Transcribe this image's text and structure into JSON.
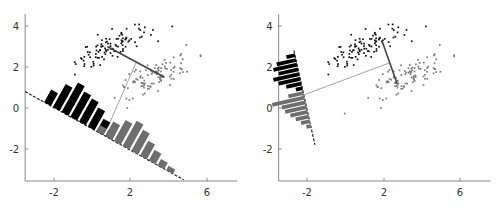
{
  "chart_data": [
    {
      "type": "scatter",
      "panel": "left",
      "title": "",
      "xlabel": "",
      "ylabel": "",
      "xlim": [
        -3.5,
        7.5
      ],
      "ylim": [
        -3.6,
        4.6
      ],
      "xticks": [
        -2,
        2,
        6
      ],
      "yticks": [
        4,
        2,
        0,
        -2
      ],
      "grid": false,
      "series": [
        {
          "name": "class 1",
          "color": "#111111",
          "center": [
            0.8,
            2.9
          ],
          "count": 100
        },
        {
          "name": "class 2",
          "color": "#888888",
          "center": [
            3.2,
            1.6
          ],
          "count": 100
        }
      ],
      "projection_line": {
        "from": [
          -3.5,
          0.8
        ],
        "to": [
          4.8,
          -3.5
        ],
        "style": "dashed"
      },
      "mean_connector": {
        "from": [
          0.8,
          3.0
        ],
        "to": [
          3.8,
          1.5
        ]
      },
      "projection_ray": {
        "from": [
          2.3,
          2.2
        ],
        "to": [
          0.8,
          -1.0
        ]
      },
      "histograms": [
        {
          "name": "class 1 projected",
          "color": "#000000",
          "bin_heights": [
            0.3,
            0.55,
            0.7,
            0.6,
            0.55,
            0.45,
            0.3,
            0.15
          ]
        },
        {
          "name": "class 2 projected",
          "color": "#666666",
          "bin_heights": [
            0.15,
            0.35,
            0.5,
            0.6,
            0.5,
            0.35,
            0.25,
            0.15,
            0.1
          ]
        }
      ]
    },
    {
      "type": "scatter",
      "panel": "right",
      "title": "",
      "xlabel": "",
      "ylabel": "",
      "xlim": [
        -3.5,
        7.5
      ],
      "ylim": [
        -3.6,
        4.6
      ],
      "xticks": [
        -2,
        2,
        6
      ],
      "yticks": [
        4,
        2,
        0,
        -2
      ],
      "grid": false,
      "series": [
        {
          "name": "class 1",
          "color": "#111111",
          "center": [
            0.8,
            2.9
          ],
          "count": 100
        },
        {
          "name": "class 2",
          "color": "#888888",
          "center": [
            3.2,
            1.6
          ],
          "count": 100
        }
      ],
      "projection_line": {
        "from": [
          -2.7,
          2.8
        ],
        "to": [
          -1.6,
          -1.8
        ],
        "style": "dashed"
      },
      "mean_connector": {
        "from": [
          1.9,
          3.3
        ],
        "to": [
          2.7,
          1.2
        ]
      },
      "projection_ray": {
        "from": [
          2.3,
          2.2
        ],
        "to": [
          -2.3,
          0.6
        ]
      },
      "histograms": [
        {
          "name": "class 1 projected",
          "color": "#000000",
          "bin_heights": [
            0.2,
            0.45,
            0.55,
            0.45,
            0.6,
            0.5,
            0.35,
            0.15
          ]
        },
        {
          "name": "class 2 projected",
          "color": "#666666",
          "bin_heights": [
            0.35,
            0.75,
            0.55,
            0.5,
            0.4,
            0.3,
            0.2,
            0.1
          ]
        }
      ]
    }
  ],
  "axes": {
    "left": {
      "x_ticks": [
        {
          "label": "-2",
          "px": 54
        },
        {
          "label": "2",
          "px": 130
        },
        {
          "label": "6",
          "px": 207
        }
      ],
      "y_ticks": [
        {
          "label": "4",
          "py": 26
        },
        {
          "label": "2",
          "py": 67
        },
        {
          "label": "0",
          "py": 108
        },
        {
          "label": "-2",
          "py": 149
        }
      ]
    },
    "right": {
      "x_ticks": [
        {
          "label": "-2",
          "px": 307
        },
        {
          "label": "2",
          "px": 384
        },
        {
          "label": "6",
          "px": 460
        }
      ],
      "y_ticks": [
        {
          "label": "4",
          "py": 26
        },
        {
          "label": "2",
          "py": 67
        },
        {
          "label": "0",
          "py": 108
        },
        {
          "label": "-2",
          "py": 149
        }
      ]
    }
  },
  "colors": {
    "class1": "#111111",
    "class2": "#7a7a7a",
    "hist1": "#000000",
    "hist2": "#6e6e6e",
    "axis": "#888888",
    "ray": "#999999",
    "connector": "#444444"
  }
}
